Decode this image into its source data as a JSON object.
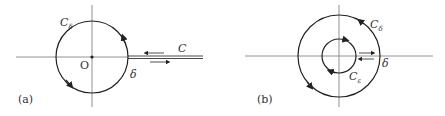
{
  "figure_a": {
    "panel_label": "(a)",
    "contour_label_main": "C",
    "contour_label_sub": "δ",
    "origin_label": "O",
    "branch_label": "C",
    "delta_label": "δ"
  },
  "figure_b": {
    "panel_label": "(b)",
    "outer_label_main": "C",
    "outer_label_sub": "δ",
    "inner_label_main": "C",
    "inner_label_sub": "ε",
    "delta_label": "δ"
  },
  "colors": {
    "line": "#222222",
    "axis": "#666666",
    "text": "#333333"
  }
}
